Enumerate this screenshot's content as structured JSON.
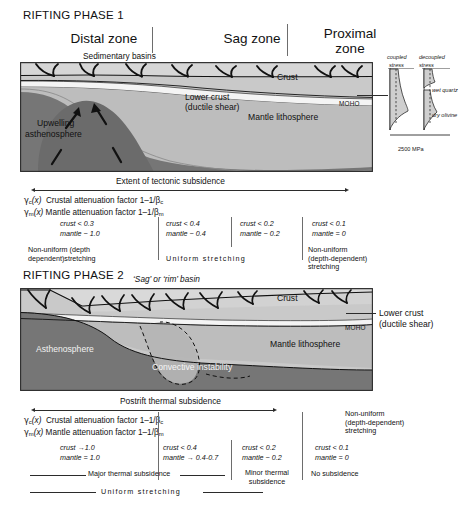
{
  "figure": {
    "title_phase1": "RIFTING PHASE 1",
    "title_phase2": "RIFTING PHASE 2"
  },
  "phase1": {
    "zones": [
      {
        "name": "distal",
        "label": "Distal zone"
      },
      {
        "name": "sag",
        "label": "Sag zone"
      },
      {
        "name": "proximal",
        "label_line1": "Proximal",
        "label_line2": "zone"
      }
    ],
    "annotations": {
      "sedimentary_basins": "Sedimentary basins",
      "crust": "Crust",
      "lower_crust_line1": "Lower crust",
      "lower_crust_line2": "(ductile shear)",
      "moho": "MOHO",
      "mantle_lithosphere": "Mantle lithosphere",
      "upwelling_line1": "Upwelling",
      "upwelling_line2": "asthenosphere"
    },
    "stress_panel": {
      "coupled_line1": "coupled",
      "coupled_line2": "stress",
      "decoupled_line1": "decoupled",
      "decoupled_line2": "stress",
      "wet_quartz": "wet quartz",
      "dry_olivine": "dry olivine",
      "scale": "2500 MPa"
    },
    "extent_label": "Extent of tectonic subsidence",
    "factors": {
      "crustal": "Crustal attenuation factor 1–1/β",
      "crustal_symbol": "γ",
      "crustal_symbol_sub": "c",
      "crustal_arg": "(x)",
      "crustal_beta_sub": "c",
      "mantle": "Mantle attenuation factor 1–1/β",
      "mantle_symbol": "γ",
      "mantle_symbol_sub": "m",
      "mantle_arg": "(x)",
      "mantle_beta_sub": "m"
    },
    "columns": [
      {
        "name": "col-1",
        "crust": "crust < 0.3",
        "mantle": "mantle ~ 1.0",
        "desc_line1": "Non-uniform (depth",
        "desc_line2": "dependent)stretching"
      },
      {
        "name": "col-2",
        "crust": "crust < 0.4",
        "mantle": "mantle ~ 0.4",
        "desc_line1": "",
        "desc_line2": ""
      },
      {
        "name": "col-3",
        "crust": "crust < 0.2",
        "mantle": "mantle ~ 0.2",
        "desc_line1": "",
        "desc_line2": ""
      },
      {
        "name": "col-4",
        "crust": "crust < 0.1",
        "mantle": "mantle = 0",
        "desc_line1": "Non-uniform",
        "desc_line2": "(depth-dependent)",
        "desc_line3": "stretching"
      }
    ],
    "uniform_stretching": "Uniform stretching"
  },
  "phase2": {
    "annotations": {
      "sag_rim_basin": "‘Sag’ or ‘rim’ basin",
      "crust": "Crust",
      "lower_crust_line1": "Lower crust",
      "lower_crust_line2": "(ductile shear)",
      "moho": "MOHO",
      "mantle_lithosphere": "Mantle lithosphere",
      "asthenosphere": "Asthenosphere",
      "convective_instability": "Convective instability"
    },
    "extent_label": "Postrift thermal subsidence",
    "factors": {
      "crustal": "Crustal attenuation factor 1–1/β",
      "crustal_symbol": "γ",
      "crustal_symbol_sub": "c",
      "crustal_arg": "(x)",
      "crustal_beta_sub": "c",
      "mantle": "Mantle attenuation factor 1–1/β",
      "mantle_symbol": "γ",
      "mantle_symbol_sub": "m",
      "mantle_arg": "(x)",
      "mantle_beta_sub": "m"
    },
    "right_note": {
      "line1": "Non-uniform",
      "line2": "(depth-dependent)",
      "line3": "stretching"
    },
    "columns": [
      {
        "name": "col-1",
        "crust": "crust →1.0",
        "mantle": "mantle = 1.0"
      },
      {
        "name": "col-2",
        "crust": "crust < 0.4",
        "mantle": "mantle → 0.4-0.7"
      },
      {
        "name": "col-3",
        "crust": "crust < 0.2",
        "mantle": "mantle ~ 0.2"
      },
      {
        "name": "col-4",
        "crust": "crust < 0.1",
        "mantle": "mantle = 0"
      }
    ],
    "major_thermal_subsidence": "Major thermal subsidence",
    "minor_thermal_line1": "Minor thermal",
    "minor_thermal_line2": "subsidence",
    "no_subsidence": "No subsidence",
    "uniform_stretching": "Uniform stretching"
  },
  "colors": {
    "crust": "#c9c9c9",
    "sediment": "#dcdcdc",
    "lower_crust": "#f2f2f2",
    "mantle_lithosphere": "#bdbdbd",
    "asthenosphere": "#767676",
    "asthenosphere_light": "#9a9a9a",
    "stroke": "#2b2b2b",
    "background": "#ffffff",
    "stress_fill": "#cfcfcf"
  }
}
